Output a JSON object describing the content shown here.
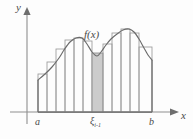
{
  "figure": {
    "kind": "riemann-sum-diagram",
    "background_color": "#fdfdfd",
    "curve_color": "#6b6b6b",
    "rect_stroke_color": "#9a9a9a",
    "highlight_color": "#c3c3c3",
    "axis_color": "#8f8f8f",
    "label_color": "#4a4a4a"
  },
  "labels": {
    "y_axis": "y",
    "x_axis": "x",
    "function": "f(x)",
    "left_endpoint": "a",
    "right_endpoint": "b",
    "sample_point": "ξ",
    "sample_point_subscript": "i-1"
  },
  "chart_data": {
    "type": "area",
    "title": "",
    "xlabel": "x",
    "ylabel": "y",
    "grid": false,
    "legend": null,
    "annotations": [
      "f(x)",
      "a",
      "b",
      "ξ i-1"
    ],
    "axis": {
      "origin_px": [
        27,
        112
      ],
      "x_axis_y_px": 112,
      "y_axis_x_px": 27,
      "x_range_px": [
        27,
        176
      ],
      "y_range_px": [
        112,
        8
      ]
    },
    "interval": {
      "a_px": 38,
      "b_px": 152,
      "a_label": "a",
      "b_label": "b"
    },
    "curve_points_px": [
      [
        38,
        80
      ],
      [
        45,
        74
      ],
      [
        52,
        67
      ],
      [
        59,
        58
      ],
      [
        64,
        50
      ],
      [
        70,
        42
      ],
      [
        76,
        38
      ],
      [
        82,
        38
      ],
      [
        87,
        44
      ],
      [
        92,
        52
      ],
      [
        97,
        56
      ],
      [
        101,
        52
      ],
      [
        106,
        45
      ],
      [
        111,
        39
      ],
      [
        117,
        34
      ],
      [
        123,
        30
      ],
      [
        129,
        29
      ],
      [
        134,
        32
      ],
      [
        139,
        39
      ],
      [
        144,
        48
      ],
      [
        148,
        55
      ],
      [
        152,
        60
      ]
    ],
    "rectangles": [
      {
        "index": 1,
        "x0_px": 38,
        "x1_px": 47,
        "top_px": 74,
        "highlighted": false
      },
      {
        "index": 2,
        "x0_px": 47,
        "x1_px": 56,
        "top_px": 62,
        "highlighted": false
      },
      {
        "index": 3,
        "x0_px": 56,
        "x1_px": 65,
        "top_px": 49,
        "highlighted": false
      },
      {
        "index": 4,
        "x0_px": 65,
        "x1_px": 74,
        "top_px": 40,
        "highlighted": false
      },
      {
        "index": 5,
        "x0_px": 74,
        "x1_px": 83,
        "top_px": 38,
        "highlighted": false
      },
      {
        "index": 6,
        "x0_px": 83,
        "x1_px": 92,
        "top_px": 41,
        "highlighted": false
      },
      {
        "index": 7,
        "x0_px": 92,
        "x1_px": 103,
        "top_px": 53,
        "highlighted": true
      },
      {
        "index": 8,
        "x0_px": 103,
        "x1_px": 112,
        "top_px": 44,
        "highlighted": false
      },
      {
        "index": 9,
        "x0_px": 112,
        "x1_px": 121,
        "top_px": 33,
        "highlighted": false
      },
      {
        "index": 10,
        "x0_px": 121,
        "x1_px": 130,
        "top_px": 29,
        "highlighted": false
      },
      {
        "index": 11,
        "x0_px": 130,
        "x1_px": 139,
        "top_px": 33,
        "highlighted": false
      },
      {
        "index": 12,
        "x0_px": 139,
        "x1_px": 152,
        "top_px": 47,
        "highlighted": false
      }
    ]
  }
}
